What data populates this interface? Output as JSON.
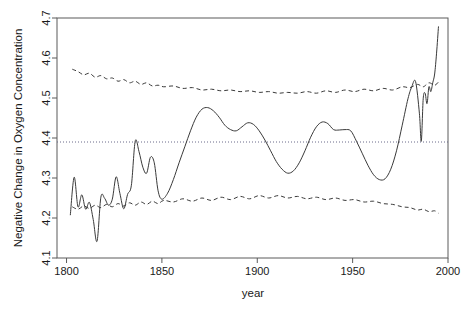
{
  "chart_data": {
    "type": "line",
    "title": "",
    "xlabel": "year",
    "ylabel": "Negative Change in Oxygen Concentration",
    "xlim": [
      1795,
      2000
    ],
    "ylim": [
      4.1,
      4.7
    ],
    "xticks": [
      1800,
      1850,
      1900,
      1950,
      2000
    ],
    "xticklabels": [
      "1800",
      "1850",
      "1900",
      "1950",
      "2000"
    ],
    "yticks": [
      4.1,
      4.2,
      4.3,
      4.4,
      4.5,
      4.6,
      4.7
    ],
    "yticklabels": [
      "4.1",
      "4.2",
      "4.3",
      "4.4",
      "4.5",
      "4.6",
      "4.7"
    ],
    "grid": false,
    "legend": "none",
    "reference_line": {
      "name": "mean-reference-line",
      "orientation": "horizontal",
      "value": 4.39,
      "style": "dotted",
      "color": "#6b6b8a"
    },
    "series": [
      {
        "name": "reconstruction",
        "style": "solid",
        "color": "#3a3a3a",
        "x": [
          1802,
          1804,
          1806,
          1808,
          1810,
          1812,
          1814,
          1816,
          1818,
          1820,
          1822,
          1824,
          1826,
          1828,
          1830,
          1832,
          1834,
          1836,
          1838,
          1840,
          1842,
          1844,
          1846,
          1848,
          1850,
          1853,
          1856,
          1859,
          1862,
          1865,
          1868,
          1871,
          1874,
          1877,
          1880,
          1883,
          1886,
          1889,
          1892,
          1895,
          1898,
          1901,
          1904,
          1907,
          1910,
          1913,
          1916,
          1919,
          1922,
          1925,
          1928,
          1931,
          1934,
          1937,
          1940,
          1943,
          1946,
          1949,
          1952,
          1955,
          1958,
          1961,
          1964,
          1967,
          1970,
          1973,
          1976,
          1979,
          1981,
          1983,
          1985,
          1986,
          1987,
          1988,
          1989,
          1990,
          1991,
          1992,
          1993,
          1994,
          1995
        ],
        "y": [
          4.208,
          4.302,
          4.228,
          4.258,
          4.222,
          4.239,
          4.196,
          4.142,
          4.252,
          4.249,
          4.232,
          4.247,
          4.303,
          4.261,
          4.223,
          4.259,
          4.282,
          4.392,
          4.366,
          4.327,
          4.312,
          4.352,
          4.338,
          4.268,
          4.247,
          4.262,
          4.296,
          4.338,
          4.378,
          4.418,
          4.452,
          4.472,
          4.476,
          4.468,
          4.452,
          4.432,
          4.421,
          4.418,
          4.428,
          4.438,
          4.434,
          4.418,
          4.395,
          4.368,
          4.341,
          4.322,
          4.312,
          4.318,
          4.338,
          4.368,
          4.402,
          4.428,
          4.44,
          4.436,
          4.421,
          4.42,
          4.421,
          4.418,
          4.392,
          4.362,
          4.332,
          4.308,
          4.296,
          4.298,
          4.322,
          4.368,
          4.432,
          4.498,
          4.528,
          4.541,
          4.462,
          4.392,
          4.498,
          4.512,
          4.486,
          4.528,
          4.516,
          4.538,
          4.56,
          4.612,
          4.678
        ]
      },
      {
        "name": "upper-confidence-band",
        "style": "dashed",
        "color": "#3a3a3a",
        "x": [
          1803,
          1806,
          1809,
          1812,
          1815,
          1818,
          1821,
          1824,
          1827,
          1830,
          1833,
          1836,
          1839,
          1842,
          1845,
          1848,
          1851,
          1856,
          1861,
          1866,
          1871,
          1876,
          1881,
          1886,
          1891,
          1896,
          1901,
          1906,
          1911,
          1916,
          1921,
          1926,
          1931,
          1936,
          1941,
          1946,
          1951,
          1956,
          1961,
          1966,
          1971,
          1976,
          1980,
          1984,
          1987,
          1990,
          1993,
          1995
        ],
        "y": [
          4.572,
          4.566,
          4.558,
          4.562,
          4.552,
          4.556,
          4.548,
          4.55,
          4.542,
          4.546,
          4.538,
          4.542,
          4.534,
          4.538,
          4.53,
          4.532,
          4.528,
          4.53,
          4.524,
          4.526,
          4.52,
          4.522,
          4.518,
          4.52,
          4.516,
          4.518,
          4.514,
          4.516,
          4.512,
          4.514,
          4.512,
          4.516,
          4.512,
          4.518,
          4.514,
          4.52,
          4.516,
          4.522,
          4.518,
          4.524,
          4.52,
          4.528,
          4.526,
          4.534,
          4.528,
          4.538,
          4.532,
          4.54
        ]
      },
      {
        "name": "lower-confidence-band",
        "style": "dashed",
        "color": "#3a3a3a",
        "x": [
          1803,
          1806,
          1809,
          1812,
          1815,
          1818,
          1821,
          1824,
          1827,
          1830,
          1833,
          1836,
          1839,
          1842,
          1845,
          1848,
          1851,
          1856,
          1861,
          1866,
          1871,
          1876,
          1881,
          1886,
          1891,
          1896,
          1901,
          1906,
          1911,
          1916,
          1921,
          1926,
          1931,
          1936,
          1941,
          1946,
          1951,
          1956,
          1961,
          1966,
          1971,
          1976,
          1980,
          1984,
          1987,
          1990,
          1993,
          1995
        ],
        "y": [
          4.228,
          4.222,
          4.23,
          4.224,
          4.232,
          4.226,
          4.234,
          4.228,
          4.236,
          4.23,
          4.238,
          4.232,
          4.24,
          4.234,
          4.242,
          4.236,
          4.244,
          4.24,
          4.248,
          4.242,
          4.25,
          4.244,
          4.252,
          4.246,
          4.254,
          4.248,
          4.256,
          4.25,
          4.256,
          4.25,
          4.254,
          4.248,
          4.252,
          4.246,
          4.25,
          4.244,
          4.246,
          4.24,
          4.242,
          4.236,
          4.234,
          4.228,
          4.226,
          4.22,
          4.222,
          4.216,
          4.218,
          4.212
        ]
      }
    ]
  }
}
